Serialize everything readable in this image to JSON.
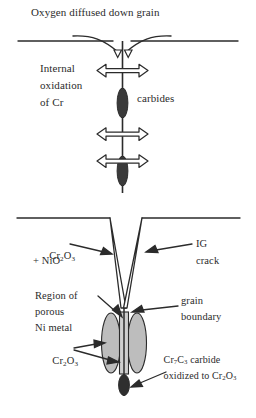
{
  "figure": {
    "domain_kind": "diagram",
    "colors": {
      "ink": "#2b2b2b",
      "background": "#ffffff",
      "carbide_fill": "#3a3a3a",
      "oxide_fill": "#b8b8b8",
      "arrow_fill_hollow": "#ffffff"
    }
  },
  "upper_panel": {
    "title": "Oxygen diffused down grain",
    "left_label": {
      "line1": "Internal",
      "line2": "oxidation",
      "line3": "of Cr"
    },
    "right_label": "carbides",
    "features": {
      "surface_line": "free surface",
      "grain_boundary": "vertical grain boundary",
      "diffusion_arrows_count": 3,
      "carbides_count": 2
    }
  },
  "lower_panel": {
    "labels": {
      "oxide_scale": {
        "line1_prefix": "Cr",
        "line1": "Cr2O3",
        "line2": "+ NiO"
      },
      "ig_crack": {
        "line1": "IG",
        "line2": "crack"
      },
      "porous_region": {
        "line1": "Region of",
        "line2": "porous",
        "line3": "Ni metal"
      },
      "grain_boundary": {
        "line1": "grain",
        "line2": "boundary"
      },
      "chromia": "Cr2O3",
      "carbide_oxidized": {
        "line1": "Cr7C3 carbide",
        "line2": "oxidized to Cr2O3"
      }
    },
    "features": {
      "surface_line": "free surface",
      "crack_shape": "narrow V wedge",
      "oxide_ellipses_count": 3,
      "carbide_below_count": 1
    }
  }
}
